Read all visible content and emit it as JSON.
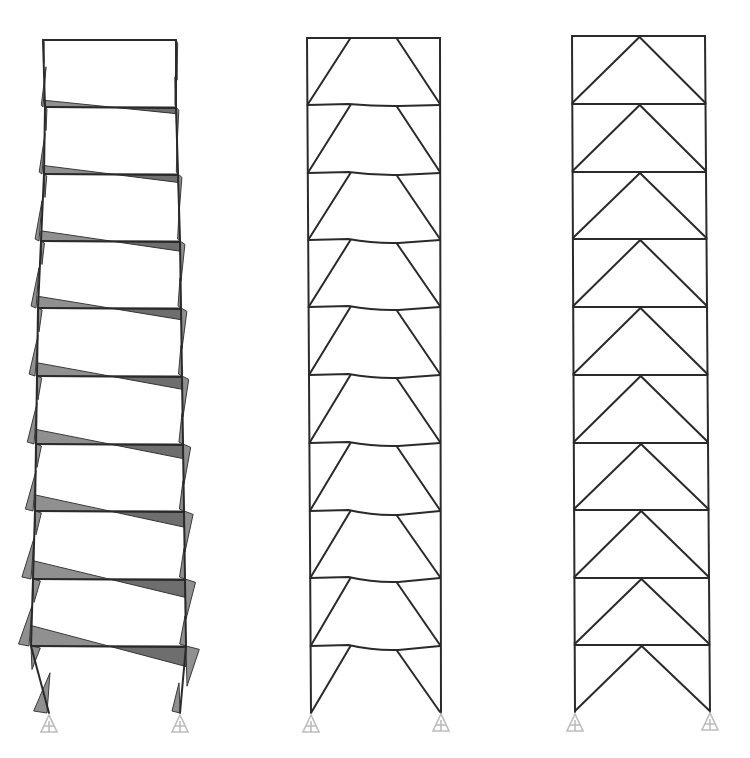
{
  "figure": {
    "colors": {
      "member": "#2a2a2a",
      "moment_fill": "#7d7d7d",
      "support": "#bdbdbd",
      "background": "#ffffff"
    },
    "frames": [
      {
        "id": "moment-frame",
        "type": "moment-resisting",
        "stories": 10,
        "x_left": 43,
        "x_right": 176,
        "drift_left": [
          43,
          45,
          44,
          41,
          38,
          37,
          36,
          35,
          33,
          31,
          49
        ],
        "drift_right": [
          176,
          176,
          178,
          180,
          181,
          182,
          183,
          184,
          185,
          186,
          180
        ],
        "floor_y": [
          40,
          107,
          174,
          241,
          308,
          376,
          444,
          511,
          579,
          646,
          713
        ],
        "show_moment_diagram": true,
        "moment_scale": [
          0.0,
          0.12,
          0.2,
          0.28,
          0.35,
          0.42,
          0.48,
          0.55,
          0.65,
          0.75,
          0.95
        ]
      },
      {
        "id": "braced-frame-deflected",
        "type": "inverted-v-braced-split",
        "stories": 10,
        "x_left": 307,
        "x_right": 440,
        "floor_y": [
          38,
          105,
          173,
          240,
          307,
          375,
          443,
          511,
          578,
          646,
          713
        ],
        "brace_top_offset": 50,
        "beam_sag": [
          0,
          1,
          2,
          3,
          3,
          3,
          3,
          4,
          4,
          4,
          0
        ]
      },
      {
        "id": "braced-frame",
        "type": "inverted-v-braced",
        "stories": 10,
        "x_left": 572,
        "x_right": 707,
        "floor_y": [
          36,
          104,
          172,
          239,
          307,
          375,
          443,
          510,
          578,
          645,
          712
        ]
      }
    ],
    "supports": [
      {
        "x": 49,
        "y": 713
      },
      {
        "x": 180,
        "y": 713
      },
      {
        "x": 311,
        "y": 713
      },
      {
        "x": 441,
        "y": 712
      },
      {
        "x": 575,
        "y": 712
      },
      {
        "x": 710,
        "y": 711
      }
    ]
  }
}
